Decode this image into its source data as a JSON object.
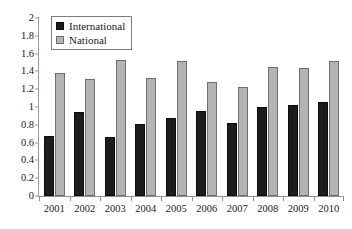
{
  "chart_data": {
    "type": "bar",
    "title": "",
    "subtitle": "",
    "xlabel": "",
    "ylabel": "",
    "categories": [
      "2001",
      "2002",
      "2003",
      "2004",
      "2005",
      "2006",
      "2007",
      "2008",
      "2009",
      "2010"
    ],
    "series": [
      {
        "name": "International",
        "color": "#1c1c1c",
        "values": [
          0.67,
          0.94,
          0.66,
          0.81,
          0.88,
          0.95,
          0.82,
          1.0,
          1.02,
          1.06
        ]
      },
      {
        "name": "National",
        "color": "#b4b4b4",
        "values": [
          1.38,
          1.32,
          1.53,
          1.33,
          1.52,
          1.28,
          1.22,
          1.45,
          1.44,
          1.52
        ]
      }
    ],
    "ylim": [
      0,
      2
    ],
    "ytick_step": 0.2,
    "ytick_labels": [
      "0",
      "0.2",
      "0.4",
      "0.6",
      "0.8",
      "1",
      "1.2",
      "1.4",
      "1.6",
      "1.8",
      "2"
    ],
    "ytick_values": [
      0,
      0.2,
      0.4,
      0.6,
      0.8,
      1.0,
      1.2,
      1.4,
      1.6,
      1.8,
      2.0
    ],
    "grid": false,
    "legend_position": "top-left",
    "legend_entries": [
      "International",
      "National"
    ],
    "annotations": []
  }
}
